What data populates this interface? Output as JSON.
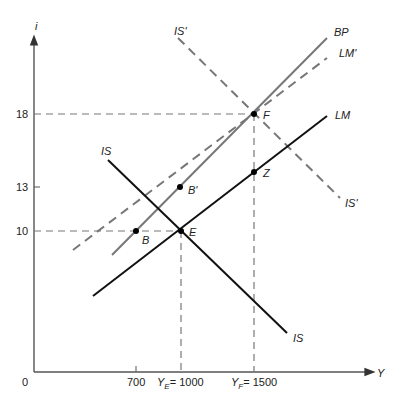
{
  "axes": {
    "y_label": "i",
    "x_label": "Y",
    "origin_label": "0",
    "y_ticks": [
      {
        "value": "18",
        "y": 114
      },
      {
        "value": "13",
        "y": 187
      },
      {
        "value": "10",
        "y": 231
      }
    ],
    "x_ticks": [
      {
        "label": "700",
        "x": 136
      },
      {
        "label_prefix": "Y",
        "label_sub": "E",
        "label_suffix": "= 1000",
        "x": 181
      },
      {
        "label_prefix": "Y",
        "label_sub": "F",
        "label_suffix": "= 1500",
        "x": 254
      }
    ]
  },
  "curves": {
    "IS": {
      "label": "IS",
      "style": "solid",
      "color": "#111111"
    },
    "IS_prime": {
      "label": "IS'",
      "style": "dashed",
      "color": "#777777"
    },
    "LM": {
      "label": "LM",
      "style": "solid",
      "color": "#111111"
    },
    "LM_prime": {
      "label": "LM'",
      "style": "dashed",
      "color": "#777777"
    },
    "BP": {
      "label": "BP",
      "style": "solid",
      "color": "#777777"
    }
  },
  "points": {
    "E": {
      "label": "E",
      "Y": 1000,
      "i": 10
    },
    "B": {
      "label": "B",
      "Y": 700,
      "i": 10
    },
    "B_prime": {
      "label": "B'",
      "Y": 1000,
      "i": 13
    },
    "F": {
      "label": "F",
      "Y": 1500,
      "i": 18
    },
    "Z": {
      "label": "Z",
      "Y": 1500,
      "i": 14
    }
  }
}
